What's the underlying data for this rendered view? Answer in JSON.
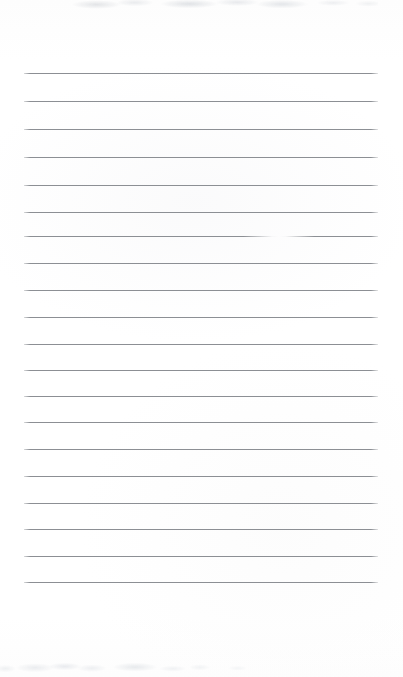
{
  "document": {
    "kind": "scanned-ruled-notepad-page",
    "page_width": 403,
    "page_height": 677,
    "background_color": "#ffffff",
    "paper_tint": "#fdfdfd",
    "written_content": "",
    "written_content_note": "No handwriting, typed text, headings or marks of any kind are present on the page."
  },
  "ruling": {
    "line_color": "#8c8f94",
    "line_thickness_px": 1,
    "line_left_x": 24,
    "line_right_x": 378,
    "line_length_px": 354,
    "line_count": 19,
    "line_spacing_px": 28,
    "first_line_y": 73,
    "last_line_y": 582,
    "lines": [
      {
        "index": 1,
        "y": 73,
        "faded": false
      },
      {
        "index": 2,
        "y": 101,
        "faded": false
      },
      {
        "index": 3,
        "y": 129,
        "faded": false
      },
      {
        "index": 4,
        "y": 157,
        "faded": false
      },
      {
        "index": 5,
        "y": 185,
        "faded": false
      },
      {
        "index": 6,
        "y": 212,
        "faded": false
      },
      {
        "index": 7,
        "y": 236,
        "faded": true
      },
      {
        "index": 8,
        "y": 263,
        "faded": false
      },
      {
        "index": 9,
        "y": 290,
        "faded": false
      },
      {
        "index": 10,
        "y": 317,
        "faded": false
      },
      {
        "index": 11,
        "y": 344,
        "faded": false
      },
      {
        "index": 12,
        "y": 370,
        "faded": false
      },
      {
        "index": 13,
        "y": 396,
        "faded": false
      },
      {
        "index": 14,
        "y": 422,
        "faded": false
      },
      {
        "index": 15,
        "y": 449,
        "faded": false
      },
      {
        "index": 16,
        "y": 476,
        "faded": false
      },
      {
        "index": 17,
        "y": 503,
        "faded": false
      },
      {
        "index": 18,
        "y": 529,
        "faded": false
      },
      {
        "index": 19,
        "y": 556,
        "faded": false
      },
      {
        "index": 20,
        "y": 582,
        "faded": false
      }
    ]
  },
  "artifacts": {
    "top_smudge": {
      "present": true,
      "x": 58,
      "y": 0,
      "width": 320,
      "height": 13,
      "description": "very faint light-gray scanner smudge band along the top edge, no legible text"
    },
    "bottom_smudge": {
      "present": true,
      "x": 0,
      "y": 655,
      "width": 270,
      "height": 22,
      "description": "very faint light-gray scanner smudge band along the bottom-left edge, no legible text"
    },
    "line_fade": {
      "present": true,
      "on_line_index": 7,
      "center_x": 258,
      "width": 34,
      "description": "bleached-out gap where the 7th ruled line briefly lightens to white"
    }
  }
}
